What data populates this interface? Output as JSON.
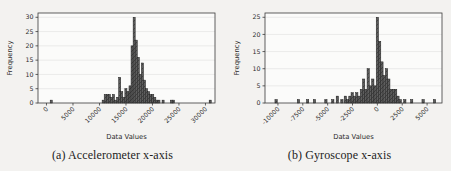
{
  "page": {
    "background": "#f3f2f0"
  },
  "figures": [
    {
      "caption": "(a) Accelerometer x-axis"
    },
    {
      "caption": "(b) Gyroscope x-axis"
    }
  ],
  "chart_data": [
    {
      "type": "bar",
      "subtype": "histogram",
      "title": "(a) Accelerometer x-axis",
      "xlabel": "Data Values",
      "ylabel": "Frequency",
      "xlim": [
        -1600,
        31800
      ],
      "ylim": [
        0,
        31.5
      ],
      "xticks": [
        0,
        5000,
        10000,
        15000,
        20000,
        25000,
        30000
      ],
      "xtick_labels": [
        "0",
        "5000",
        "10000",
        "15000",
        "20000",
        "25000",
        "30000"
      ],
      "yticks": [
        0,
        5,
        10,
        15,
        20,
        25,
        30
      ],
      "grid": true,
      "legend": null,
      "bin_width": 390,
      "bars": [
        [
          700,
          1
        ],
        [
          10500,
          1
        ],
        [
          10890,
          3
        ],
        [
          11280,
          3
        ],
        [
          11670,
          3
        ],
        [
          12060,
          2
        ],
        [
          12450,
          3
        ],
        [
          12840,
          1
        ],
        [
          13230,
          2
        ],
        [
          13620,
          9
        ],
        [
          14010,
          4
        ],
        [
          14400,
          2
        ],
        [
          14790,
          5
        ],
        [
          15180,
          4
        ],
        [
          15570,
          6
        ],
        [
          15960,
          20
        ],
        [
          16350,
          30
        ],
        [
          16740,
          22
        ],
        [
          17130,
          16
        ],
        [
          17520,
          10
        ],
        [
          17910,
          14
        ],
        [
          18300,
          8
        ],
        [
          18690,
          5
        ],
        [
          19080,
          4
        ],
        [
          19470,
          3
        ],
        [
          19860,
          3
        ],
        [
          20250,
          2
        ],
        [
          20640,
          1
        ],
        [
          21030,
          1
        ],
        [
          21810,
          1
        ],
        [
          23370,
          1
        ],
        [
          23760,
          1
        ],
        [
          30700,
          1
        ]
      ],
      "colors": {
        "bar": "#5d5d5d",
        "edge": "#1f1f1f",
        "hatch": "#2e2e2e",
        "grid": "#e2e2e2",
        "spine": "#3a3a3a",
        "text": "#2b2b2b",
        "plot_bg": "#fbfbfa"
      }
    },
    {
      "type": "bar",
      "subtype": "histogram",
      "title": "(b) Gyroscope x-axis",
      "xlabel": "Data Values",
      "ylabel": "Frequency",
      "xlim": [
        -11300,
        6500
      ],
      "ylim": [
        0,
        26.25
      ],
      "xticks": [
        -10000,
        -7500,
        -5000,
        -2500,
        0,
        2500,
        5000
      ],
      "xtick_labels": [
        "-10000",
        "-7500",
        "-5000",
        "-2500",
        "0",
        "2500",
        "5000"
      ],
      "yticks": [
        0,
        5,
        10,
        15,
        20,
        25
      ],
      "grid": true,
      "legend": null,
      "bin_width": 230,
      "bars": [
        [
          -10300,
          1
        ],
        [
          -8050,
          1
        ],
        [
          -7130,
          1
        ],
        [
          -6440,
          1
        ],
        [
          -5290,
          1
        ],
        [
          -4600,
          1
        ],
        [
          -4140,
          2
        ],
        [
          -3680,
          1
        ],
        [
          -3335,
          2
        ],
        [
          -3105,
          1
        ],
        [
          -2875,
          2
        ],
        [
          -2645,
          3
        ],
        [
          -2415,
          2
        ],
        [
          -2185,
          3
        ],
        [
          -1955,
          2
        ],
        [
          -1725,
          4
        ],
        [
          -1495,
          7
        ],
        [
          -1265,
          4
        ],
        [
          -1035,
          10
        ],
        [
          -805,
          5
        ],
        [
          -575,
          7
        ],
        [
          -345,
          5
        ],
        [
          -115,
          25
        ],
        [
          115,
          18
        ],
        [
          345,
          12
        ],
        [
          575,
          8
        ],
        [
          805,
          10
        ],
        [
          1035,
          7
        ],
        [
          1265,
          4
        ],
        [
          1495,
          4
        ],
        [
          1725,
          4
        ],
        [
          1955,
          2
        ],
        [
          2185,
          1
        ],
        [
          2645,
          1
        ],
        [
          3335,
          1
        ],
        [
          4485,
          1
        ],
        [
          5635,
          1
        ]
      ],
      "colors": {
        "bar": "#5d5d5d",
        "edge": "#1f1f1f",
        "hatch": "#2e2e2e",
        "grid": "#e2e2e2",
        "spine": "#3a3a3a",
        "text": "#2b2b2b",
        "plot_bg": "#fbfbfa"
      }
    }
  ]
}
